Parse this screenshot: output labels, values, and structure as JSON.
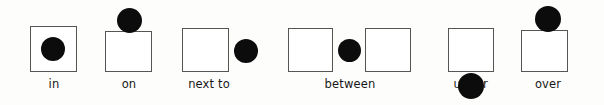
{
  "figure": {
    "background_color": "#fdfdfb",
    "box_stroke_color": "#555553",
    "ball_fill_color": "#0c0c0c",
    "groups": [
      {
        "id": "in",
        "label": "in",
        "boxes": 1,
        "ball_position": "inside-center"
      },
      {
        "id": "on",
        "label": "on",
        "boxes": 1,
        "ball_position": "above-touching-top-edge"
      },
      {
        "id": "next-to",
        "label": "next to",
        "boxes": 1,
        "ball_position": "right-of-box"
      },
      {
        "id": "between",
        "label": "between",
        "boxes": 2,
        "ball_position": "middle-of-two-boxes"
      },
      {
        "id": "under",
        "label": "under",
        "boxes": 1,
        "ball_position": "below-box"
      },
      {
        "id": "over",
        "label": "over",
        "boxes": 1,
        "ball_position": "above-box"
      }
    ]
  }
}
